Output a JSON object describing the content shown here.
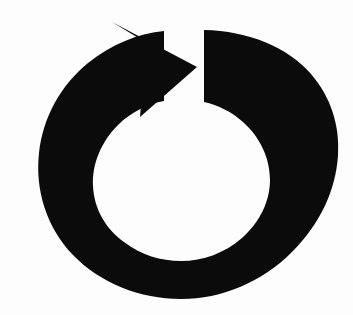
{
  "canvas": {
    "width": 353,
    "height": 315,
    "background_color": "#fdfdfd"
  },
  "icon": {
    "name": "refresh-icon",
    "semantic_name": "reload-refresh-arrow-icon",
    "label": "Refresh",
    "description": "Thick black circular arrow open at the top with an arrowhead pointing clockwise",
    "fill_color": "#0b0b0b",
    "rotation_direction": "clockwise",
    "style": "solid-silhouette",
    "geometry": {
      "ring_outer_bounds": {
        "left": 37,
        "top": 30,
        "right": 332,
        "bottom": 299
      },
      "ring_inner_bounds": {
        "left": 79,
        "top": 99,
        "right": 270,
        "bottom": 241
      },
      "gap_top_left_x": 160,
      "gap_top_right_x": 204,
      "arrow_tip": {
        "x": 197,
        "y": 67
      },
      "arrow_top_vertex": {
        "x": 112,
        "y": 22
      },
      "arrow_barb_point": {
        "x": 140,
        "y": 117
      },
      "tail_cut_edge": {
        "x": 204,
        "y_top": 30,
        "y_bottom": 106
      }
    }
  }
}
